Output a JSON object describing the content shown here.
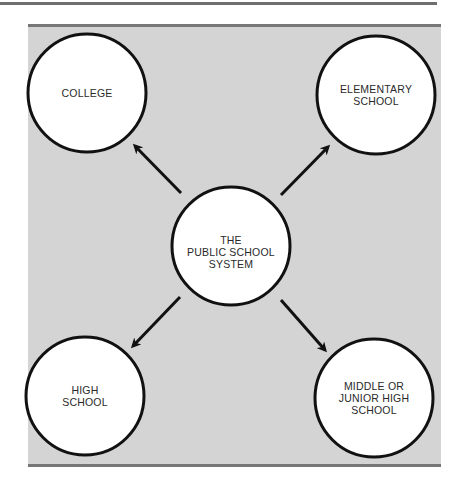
{
  "diagram": {
    "colors": {
      "panel_background": "#d4d4d4",
      "panel_border": "#777777",
      "circle_fill": "#ffffff",
      "circle_stroke": "#111111",
      "arrow": "#111111",
      "text": "#2a2a2a"
    },
    "center_node": {
      "id": "public-school-system",
      "label": "THE\nPUBLIC SCHOOL\nSYSTEM"
    },
    "nodes": [
      {
        "id": "college",
        "label": "COLLEGE",
        "position": "top-left"
      },
      {
        "id": "elementary-school",
        "label": "ELEMENTARY\nSCHOOL",
        "position": "top-right"
      },
      {
        "id": "high-school",
        "label": "HIGH\nSCHOOL",
        "position": "bottom-left"
      },
      {
        "id": "middle-or-junior-high-school",
        "label": "MIDDLE OR\nJUNIOR HIGH\nSCHOOL",
        "position": "bottom-right"
      }
    ],
    "edges": [
      {
        "from": "public-school-system",
        "to": "college"
      },
      {
        "from": "public-school-system",
        "to": "elementary-school"
      },
      {
        "from": "public-school-system",
        "to": "high-school"
      },
      {
        "from": "public-school-system",
        "to": "middle-or-junior-high-school"
      }
    ]
  }
}
